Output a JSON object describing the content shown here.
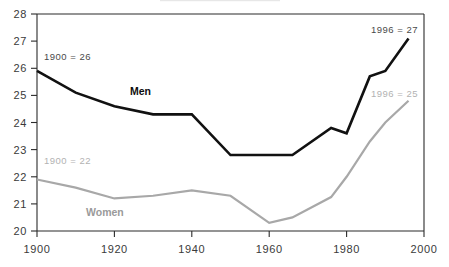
{
  "chart_data": {
    "type": "line",
    "title": "",
    "xlabel": "",
    "ylabel": "",
    "xlim": [
      1900,
      2000
    ],
    "ylim": [
      20,
      28
    ],
    "grid": false,
    "legend_position": "inline-labels",
    "xticks": [
      1900,
      1920,
      1940,
      1960,
      1980,
      2000
    ],
    "yticks": [
      20,
      21,
      22,
      23,
      24,
      25,
      26,
      27,
      28
    ],
    "xtick_labels": [
      "1900",
      "1920",
      "1940",
      "1960",
      "1980",
      "2000"
    ],
    "ytick_labels": [
      "20",
      "21",
      "22",
      "23",
      "24",
      "25",
      "26",
      "27",
      "28"
    ],
    "series": [
      {
        "name": "Men",
        "color": "#111111",
        "x": [
          1900,
          1910,
          1920,
          1930,
          1940,
          1950,
          1960,
          1966,
          1976,
          1980,
          1986,
          1990,
          1996
        ],
        "values": [
          25.9,
          25.1,
          24.6,
          24.3,
          24.3,
          22.8,
          22.8,
          22.8,
          23.8,
          23.6,
          25.7,
          25.9,
          27.1
        ]
      },
      {
        "name": "Women",
        "color": "#a8a8a8",
        "x": [
          1900,
          1910,
          1920,
          1930,
          1940,
          1950,
          1960,
          1966,
          1976,
          1980,
          1986,
          1990,
          1996
        ],
        "values": [
          21.9,
          21.6,
          21.2,
          21.3,
          21.5,
          21.3,
          20.3,
          20.5,
          21.25,
          22.0,
          23.3,
          24.0,
          24.8
        ]
      }
    ],
    "annotations": [
      {
        "text": "1900 = 26",
        "series": "Men",
        "color": "#4a4a4a"
      },
      {
        "text": "1996 = 27",
        "series": "Men",
        "color": "#4a4a4a"
      },
      {
        "text": "1900 = 22",
        "series": "Women",
        "color": "#b2b2b2"
      },
      {
        "text": "1996 = 25",
        "series": "Women",
        "color": "#b2b2b2"
      }
    ],
    "series_labels": [
      {
        "text": "Men",
        "color": "#111111"
      },
      {
        "text": "Women",
        "color": "#9a9a9a"
      }
    ]
  }
}
